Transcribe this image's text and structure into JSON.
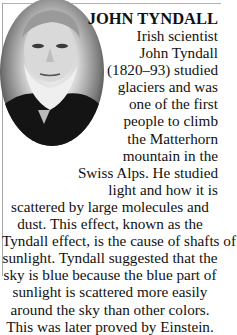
{
  "figure": {
    "image_alt": "Portrait of John Tyndall",
    "title": "JOHN TYNDALL",
    "lines": [
      "Irish scientist",
      "John Tyndall",
      "(1820–93) studied",
      "glaciers and was",
      "one of the first",
      "people to climb",
      "the Matterhorn",
      "mountain in the",
      "Swiss Alps. He studied",
      "light and how it is",
      "scattered by large molecules and",
      "dust. This effect, known as the",
      "Tyndall effect, is the cause of shafts of",
      "sunlight. Tyndall suggested that the",
      "sky is blue because the blue part of",
      "sunlight is scattered more easily",
      "around the sky than other colors.",
      "This was later proved by Einstein."
    ]
  }
}
